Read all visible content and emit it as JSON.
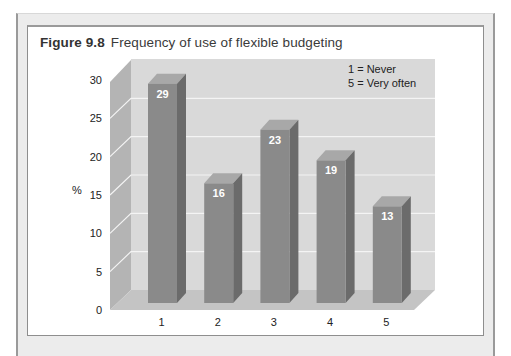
{
  "figure": {
    "number": "Figure 9.8",
    "title": "Frequency of use of flexible budgeting"
  },
  "legend": {
    "lines": [
      "1 = Never",
      "5 = Very often"
    ]
  },
  "colors": {
    "bar_front": "#8a8a8a",
    "bar_side": "#6b6b6b",
    "bar_top": "#a8a8a8",
    "back_wall": "#d9d9d9",
    "side_wall": "#b4b4b4",
    "floor": "#c4c4c4",
    "gridline": "#f4f4f4"
  },
  "chart_data": {
    "type": "bar",
    "categories": [
      "1",
      "2",
      "3",
      "4",
      "5"
    ],
    "values": [
      29,
      16,
      23,
      19,
      13
    ],
    "xlabel": "",
    "ylabel": "%",
    "ylim": [
      0,
      30
    ],
    "yticks": [
      0,
      5,
      10,
      15,
      20,
      25,
      30
    ],
    "grid": true,
    "style": "3d",
    "legend_position": "top-right (inside plot)",
    "annotations": [
      "1 = Never",
      "5 = Very often"
    ],
    "data_labels": [
      "29",
      "16",
      "23",
      "19",
      "13"
    ]
  }
}
